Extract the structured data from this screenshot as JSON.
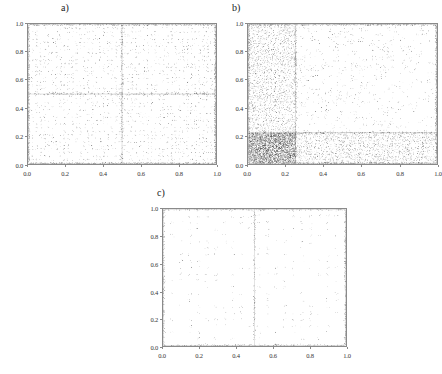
{
  "figure": {
    "background_color": "#ffffff",
    "frame_color": "#8a8a8a",
    "point_color": "#333333"
  },
  "panels": [
    {
      "id": "a",
      "label": "a)",
      "xlabel": "",
      "ylabel": "",
      "xticks": [
        "0.0",
        "0.2",
        "0.4",
        "0.6",
        "0.8",
        "1.0"
      ],
      "yticks": [
        "0.0",
        "0.2",
        "0.4",
        "0.6",
        "0.8",
        "1.0"
      ],
      "xtick_values": [
        0.0,
        0.2,
        0.4,
        0.6,
        0.8,
        1.0
      ],
      "ytick_values": [
        0.0,
        0.2,
        0.4,
        0.6,
        0.8,
        1.0
      ]
    },
    {
      "id": "b",
      "label": "b)",
      "xlabel": "",
      "ylabel": "",
      "xticks": [
        "0.0",
        "0.2",
        "0.4",
        "0.6",
        "0.8",
        "1.0"
      ],
      "yticks": [
        "0.0",
        "0.2",
        "0.4",
        "0.6",
        "0.8",
        "1.0"
      ],
      "xtick_values": [
        0.0,
        0.2,
        0.4,
        0.6,
        0.8,
        1.0
      ],
      "ytick_values": [
        0.0,
        0.2,
        0.4,
        0.6,
        0.8,
        1.0
      ]
    },
    {
      "id": "c",
      "label": "c)",
      "xlabel": "",
      "ylabel": "",
      "xticks": [
        "0.0",
        "0.2",
        "0.4",
        "0.6",
        "0.8",
        "1.0"
      ],
      "yticks": [
        "0.0",
        "0.2",
        "0.4",
        "0.6",
        "0.8",
        "1.0"
      ],
      "xtick_values": [
        0.0,
        0.2,
        0.4,
        0.6,
        0.8,
        1.0
      ],
      "ytick_values": [
        0.0,
        0.2,
        0.4,
        0.6,
        0.8,
        1.0
      ]
    }
  ],
  "chart_data": [
    {
      "type": "scatter",
      "panel": "a",
      "title": "a)",
      "xlabel": "",
      "ylabel": "",
      "xlim": [
        0.0,
        1.0
      ],
      "ylim": [
        0.0,
        1.0
      ],
      "grid": false,
      "legend": null,
      "marker": "pixel-dot",
      "marker_size": 0.8,
      "color": "#333333",
      "n_points": 9000,
      "description": "Dense quasi-periodic lattice scatter filling the unit square. Strong vertical accumulation band at x=0.50 and strong horizontal accumulation band at y=0.50, plus saturated bands along all four edges (x=0.0, x=1.0, y=0.0, y=1.0). Point density is approximately uniform elsewhere with faint secondary vertical striations at multiples of 1/24.",
      "structure": {
        "lattice_columns": 48,
        "lattice_rows": 40,
        "dense_vertical_lines_x": [
          0.0,
          0.5,
          1.0
        ],
        "dense_horizontal_lines_y": [
          0.0,
          0.5,
          1.0
        ],
        "jitter": 0.006
      }
    },
    {
      "type": "scatter",
      "panel": "b",
      "title": "b)",
      "xlabel": "",
      "ylabel": "",
      "xlim": [
        0.0,
        1.0
      ],
      "ylim": [
        0.0,
        1.0
      ],
      "grid": false,
      "legend": null,
      "marker": "pixel-dot",
      "marker_size": 0.8,
      "color": "#333333",
      "n_points": 12000,
      "description": "Dense quasi-periodic lattice scatter with a heavy concentration in the lower-left quadrant. A saturated vertical band runs at x=0.25 and a saturated horizontal band at y=0.22. The region x<0.25 is markedly darker across all y, and the region y<0.22 is markedly darker across all x, producing a dark block near (0.0-0.25, 0.0-0.22). Density decreases toward the upper right.",
      "structure": {
        "lattice_columns": 52,
        "lattice_rows": 44,
        "dense_vertical_lines_x": [
          0.0,
          0.25,
          1.0
        ],
        "dense_horizontal_lines_y": [
          0.0,
          0.22,
          1.0
        ],
        "dense_region_x": [
          0.0,
          0.25
        ],
        "dense_region_y": [
          0.0,
          0.22
        ],
        "jitter": 0.008
      }
    },
    {
      "type": "scatter",
      "panel": "c",
      "title": "c)",
      "xlabel": "",
      "ylabel": "",
      "xlim": [
        0.0,
        1.0
      ],
      "ylim": [
        0.0,
        1.0
      ],
      "grid": false,
      "legend": null,
      "marker": "pixel-dot",
      "marker_size": 0.8,
      "color": "#333333",
      "n_points": 3000,
      "description": "Sparse regular lattice scatter. Points sit on a coarse grid of roughly 22 columns by 22 rows with small jitter. Saturated bands along the left edge (x=0.0), right edge (x=1.0), bottom edge (y=0.0) and top edge (y=1.0). A moderately dense vertical line at x=0.5. Interior density is low and nearly uniform.",
      "structure": {
        "lattice_columns": 22,
        "lattice_rows": 22,
        "dense_vertical_lines_x": [
          0.0,
          0.5,
          1.0
        ],
        "dense_horizontal_lines_y": [
          0.0,
          1.0
        ],
        "jitter": 0.01
      }
    }
  ]
}
